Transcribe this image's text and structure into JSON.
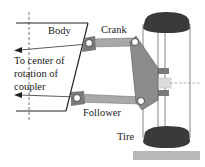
{
  "diagram": {
    "labels": {
      "body": "Body",
      "crank": "Crank",
      "follower": "Follower",
      "tire": "Tire",
      "annotation_line1": "To center of",
      "annotation_line2": "rotation of",
      "annotation_line3": "coupler"
    },
    "colors": {
      "line": "#222222",
      "link": "#a8a8a8",
      "link_dark": "#6e6e6e",
      "upright": "#8c8c8c",
      "tire": "#3a3a3a",
      "ground": "#b8b8b8",
      "hub": "#7a7a7a"
    }
  }
}
